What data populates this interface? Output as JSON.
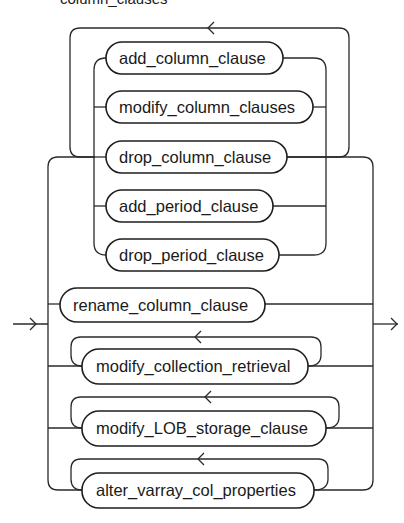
{
  "title": "column_clauses",
  "diagram": {
    "type": "railroad-syntax",
    "entry_arrow": "right-arrow",
    "exit_arrow": "right-arrow",
    "groups": [
      {
        "name": "column-clause-group",
        "repeatable": true,
        "items": [
          {
            "label": "add_column_clause"
          },
          {
            "label": "modify_column_clauses"
          },
          {
            "label": "drop_column_clause"
          },
          {
            "label": "add_period_clause"
          },
          {
            "label": "drop_period_clause"
          }
        ]
      }
    ],
    "alternatives": [
      {
        "label": "rename_column_clause",
        "repeatable": false
      },
      {
        "label": "modify_collection_retrieval",
        "repeatable": true
      },
      {
        "label": "modify_LOB_storage_clause",
        "repeatable": true
      },
      {
        "label": "alter_varray_col_properties",
        "repeatable": true
      }
    ]
  },
  "colors": {
    "line": "#2a2a2a",
    "text": "#1a1a1a",
    "background": "#ffffff"
  }
}
